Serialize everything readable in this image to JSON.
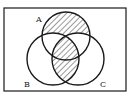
{
  "diagram": {
    "type": "venn",
    "sets": [
      {
        "id": "A",
        "label": "A",
        "cx": 66,
        "cy": 36,
        "r": 24,
        "label_x": 36,
        "label_y": 22
      },
      {
        "id": "B",
        "label": "B",
        "cx": 53,
        "cy": 59,
        "r": 26,
        "label_x": 26,
        "label_y": 87
      },
      {
        "id": "C",
        "label": "C",
        "cx": 78,
        "cy": 59,
        "r": 26,
        "label_x": 100,
        "label_y": 87
      }
    ],
    "shaded_regions": [
      "A only (A − B − C)",
      "B ∩ C"
    ],
    "frame": {
      "x": 4,
      "y": 8,
      "width": 122,
      "height": 83
    },
    "colors": {
      "stroke": "#1a1a1a",
      "background": "#ffffff",
      "hatch": "#333333"
    }
  }
}
